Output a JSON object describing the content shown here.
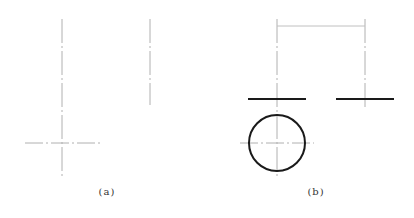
{
  "figures": [
    {
      "id": "a",
      "label": "(a)",
      "label_pos": {
        "x": 107,
        "y": 186
      },
      "center_lines_vertical": [
        {
          "x": 62,
          "y1": 19,
          "y2": 177
        },
        {
          "x": 150,
          "y1": 19,
          "y2": 105
        }
      ],
      "center_lines_horizontal": [
        {
          "y": 143,
          "x1": 25,
          "x2": 100
        }
      ]
    },
    {
      "id": "b",
      "label": "(b)",
      "label_pos": {
        "x": 316,
        "y": 186
      },
      "center_lines_vertical": [
        {
          "x": 277,
          "y1": 19,
          "y2": 177
        },
        {
          "x": 365,
          "y1": 19,
          "y2": 108
        }
      ],
      "center_lines_horizontal": [
        {
          "y": 143,
          "x1": 240,
          "x2": 314
        }
      ],
      "thin_lines": [
        {
          "x1": 277,
          "y1": 26,
          "x2": 365,
          "y2": 26
        }
      ],
      "thick_lines": [
        {
          "x1": 248,
          "y1": 99,
          "x2": 306,
          "y2": 99
        },
        {
          "x1": 336,
          "y1": 99,
          "x2": 394,
          "y2": 99
        }
      ],
      "circles": [
        {
          "cx": 277,
          "cy": 143,
          "r": 28
        }
      ]
    }
  ],
  "colors": {
    "center_line": "#b0b0b0",
    "thin_line": "#c0c0c0",
    "thick_line": "#1a1a1a"
  }
}
